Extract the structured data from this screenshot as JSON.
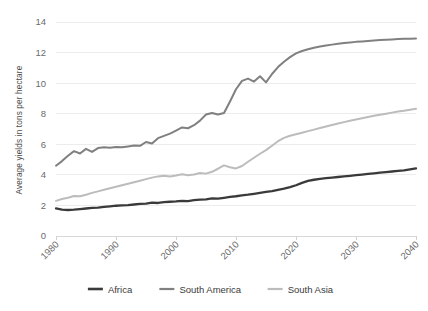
{
  "chart_data": {
    "type": "line",
    "title": "",
    "subtitle": "",
    "xlabel": "",
    "ylabel": "Average yields in tons per hectare",
    "xlim": [
      1980,
      2040
    ],
    "ylim": [
      0,
      14
    ],
    "x_ticks": [
      1980,
      1990,
      2000,
      2010,
      2020,
      2030,
      2040
    ],
    "y_ticks": [
      0,
      2,
      4,
      6,
      8,
      10,
      12,
      14
    ],
    "x_tick_labels": [
      "1980",
      "1990",
      "2000",
      "2010",
      "2020",
      "2030",
      "2040"
    ],
    "y_tick_labels": [
      "0",
      "2",
      "4",
      "6",
      "8",
      "10",
      "12",
      "14"
    ],
    "grid": "horizontal",
    "legend_position": "bottom",
    "x": [
      1980,
      1981,
      1982,
      1983,
      1984,
      1985,
      1986,
      1987,
      1988,
      1989,
      1990,
      1991,
      1992,
      1993,
      1994,
      1995,
      1996,
      1997,
      1998,
      1999,
      2000,
      2001,
      2002,
      2003,
      2004,
      2005,
      2006,
      2007,
      2008,
      2009,
      2010,
      2011,
      2012,
      2013,
      2014,
      2015,
      2016,
      2017,
      2018,
      2019,
      2020,
      2021,
      2022,
      2023,
      2024,
      2025,
      2026,
      2027,
      2028,
      2029,
      2030,
      2031,
      2032,
      2033,
      2034,
      2035,
      2036,
      2037,
      2038,
      2039,
      2040
    ],
    "series": [
      {
        "name": "Africa",
        "color": "#3a3a3a",
        "width": 2.3,
        "values": [
          1.8,
          1.72,
          1.7,
          1.72,
          1.76,
          1.8,
          1.84,
          1.86,
          1.9,
          1.94,
          1.98,
          2.0,
          2.02,
          2.06,
          2.1,
          2.12,
          2.18,
          2.16,
          2.22,
          2.24,
          2.26,
          2.3,
          2.28,
          2.34,
          2.38,
          2.4,
          2.46,
          2.44,
          2.5,
          2.56,
          2.6,
          2.66,
          2.7,
          2.76,
          2.82,
          2.88,
          2.94,
          3.02,
          3.1,
          3.2,
          3.32,
          3.48,
          3.6,
          3.68,
          3.74,
          3.78,
          3.82,
          3.86,
          3.9,
          3.94,
          3.98,
          4.02,
          4.06,
          4.1,
          4.14,
          4.18,
          4.22,
          4.26,
          4.3,
          4.36,
          4.42
        ]
      },
      {
        "name": "South America",
        "color": "#808080",
        "width": 2.0,
        "values": [
          4.6,
          4.9,
          5.25,
          5.55,
          5.4,
          5.7,
          5.5,
          5.75,
          5.8,
          5.78,
          5.82,
          5.8,
          5.86,
          5.92,
          5.9,
          6.15,
          6.05,
          6.4,
          6.55,
          6.7,
          6.9,
          7.1,
          7.05,
          7.25,
          7.55,
          7.95,
          8.05,
          7.95,
          8.05,
          8.8,
          9.6,
          10.15,
          10.3,
          10.1,
          10.45,
          10.05,
          10.6,
          11.05,
          11.4,
          11.7,
          11.95,
          12.1,
          12.22,
          12.32,
          12.4,
          12.46,
          12.52,
          12.57,
          12.62,
          12.66,
          12.7,
          12.73,
          12.76,
          12.79,
          12.82,
          12.84,
          12.86,
          12.88,
          12.9,
          12.91,
          12.92
        ]
      },
      {
        "name": "South Asia",
        "color": "#bcbcbc",
        "width": 2.0,
        "values": [
          2.3,
          2.42,
          2.5,
          2.62,
          2.6,
          2.7,
          2.82,
          2.92,
          3.02,
          3.12,
          3.22,
          3.32,
          3.42,
          3.52,
          3.62,
          3.72,
          3.82,
          3.9,
          3.94,
          3.9,
          3.96,
          4.04,
          3.98,
          4.02,
          4.12,
          4.08,
          4.2,
          4.4,
          4.62,
          4.5,
          4.42,
          4.58,
          4.86,
          5.12,
          5.38,
          5.62,
          5.9,
          6.2,
          6.42,
          6.56,
          6.66,
          6.76,
          6.86,
          6.96,
          7.06,
          7.16,
          7.26,
          7.36,
          7.45,
          7.54,
          7.62,
          7.7,
          7.78,
          7.86,
          7.93,
          8.0,
          8.07,
          8.14,
          8.2,
          8.26,
          8.32
        ]
      }
    ]
  },
  "legend": {
    "items": [
      {
        "label": "Africa",
        "color": "#3a3a3a",
        "width": 2.6
      },
      {
        "label": "South America",
        "color": "#808080",
        "width": 2.2
      },
      {
        "label": "South Asia",
        "color": "#bcbcbc",
        "width": 2.2
      }
    ]
  }
}
